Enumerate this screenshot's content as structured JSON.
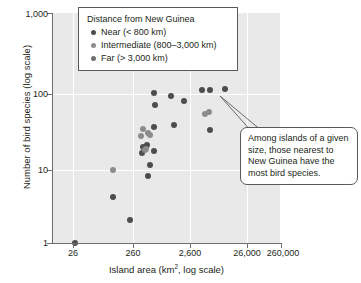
{
  "chart_data": {
    "type": "scatter",
    "title": "",
    "xlabel": "Island area (km2, log scale)",
    "xlabel_main": "Island area (km",
    "xlabel_sup": "2",
    "xlabel_tail": ", log scale)",
    "ylabel": "Number of bird species (log scale)",
    "xscale": "log",
    "yscale": "log",
    "xlim": [
      8.2,
      820000
    ],
    "ylim": [
      1,
      1000
    ],
    "grid": true,
    "gridlines_x": [
      26,
      260,
      2600,
      26000,
      260000
    ],
    "gridlines_y": [
      10,
      100
    ],
    "xticks": [
      26,
      260,
      2600,
      26000,
      260000
    ],
    "xtick_labels": [
      "26",
      "260",
      "2,600",
      "26,000",
      "260,000"
    ],
    "yticks": [
      1,
      10,
      100,
      1000
    ],
    "ytick_labels": [
      "1",
      "10",
      "100",
      "1,000"
    ],
    "legend_position": "top-center",
    "series": [
      {
        "name": "Near (< 800 km)",
        "color": "#4d4d4f",
        "points": [
          {
            "x": 1400,
            "y": 90
          },
          {
            "x": 3400,
            "y": 82
          },
          {
            "x": 6500,
            "y": 72
          },
          {
            "x": 16000,
            "y": 100
          },
          {
            "x": 24000,
            "y": 100
          },
          {
            "x": 52000,
            "y": 101
          },
          {
            "x": 1500,
            "y": 63
          },
          {
            "x": 3900,
            "y": 35
          },
          {
            "x": 1450,
            "y": 33
          },
          {
            "x": 24000,
            "y": 30
          },
          {
            "x": 1450,
            "y": 16
          },
          {
            "x": 780,
            "y": 15
          },
          {
            "x": 820,
            "y": 18
          },
          {
            "x": 1000,
            "y": 19
          },
          {
            "x": 1150,
            "y": 10.5
          },
          {
            "x": 1050,
            "y": 7.5
          },
          {
            "x": 175,
            "y": 4
          },
          {
            "x": 420,
            "y": 2
          },
          {
            "x": 26,
            "y": 1
          }
        ]
      },
      {
        "name": "Intermediate (800–3,000 km)",
        "color": "#8c8c8e",
        "points": [
          {
            "x": 19000,
            "y": 48
          },
          {
            "x": 23000,
            "y": 51
          },
          {
            "x": 830,
            "y": 31
          },
          {
            "x": 720,
            "y": 25
          },
          {
            "x": 1020,
            "y": 27
          },
          {
            "x": 1130,
            "y": 26
          },
          {
            "x": 960,
            "y": 17
          },
          {
            "x": 900,
            "y": 16.5
          },
          {
            "x": 175,
            "y": 9
          }
        ]
      },
      {
        "name": "Far (> 3,000 km)",
        "color": "#6d6e71",
        "points": []
      }
    ],
    "annotations": [
      {
        "text": "Among islands of a given size, those nearest to New Guinea have the most bird species.",
        "points_to": [
          {
            "x": 24000,
            "y": 100
          },
          {
            "x": 16000,
            "y": 100
          }
        ]
      }
    ]
  },
  "legend": {
    "title": "Distance from New Guinea",
    "items": [
      {
        "label": "Near (< 800 km)",
        "color": "#4d4d4f"
      },
      {
        "label": "Intermediate (800–3,000 km)",
        "color": "#8c8c8e"
      },
      {
        "label": "Far (> 3,000 km)",
        "color": "#6d6e71"
      }
    ]
  },
  "callout": {
    "text": "Among islands of a given size, those nearest to New Guinea have the most bird species."
  }
}
